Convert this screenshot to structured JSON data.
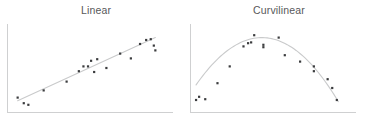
{
  "figure": {
    "background_color": "#ffffff",
    "panel_count": 2
  },
  "panels": [
    {
      "id": "linear",
      "title": "Linear"
    },
    {
      "id": "curvilinear",
      "title": "Curvilinear"
    }
  ],
  "chart_data": [
    {
      "type": "scatter",
      "title": "Linear",
      "xlabel": "",
      "ylabel": "",
      "grid": false,
      "legend": null,
      "axes": {
        "left_spine": true,
        "bottom_spine": true,
        "ticks": false,
        "tick_labels": false
      },
      "axis_color": "#cfd0d1",
      "point_color": "#3b3c3e",
      "trendline": {
        "kind": "linear",
        "color": "#c9cacb",
        "x_start": 5,
        "y_start": 9,
        "x_end": 95,
        "y_end": 88
      },
      "xlim": [
        0,
        100
      ],
      "ylim": [
        0,
        100
      ],
      "points": [
        {
          "x": 5,
          "y": 13
        },
        {
          "x": 9,
          "y": 6
        },
        {
          "x": 12,
          "y": 4
        },
        {
          "x": 22,
          "y": 22
        },
        {
          "x": 37,
          "y": 33
        },
        {
          "x": 45,
          "y": 46
        },
        {
          "x": 48,
          "y": 52
        },
        {
          "x": 51,
          "y": 52
        },
        {
          "x": 53,
          "y": 59
        },
        {
          "x": 55,
          "y": 45
        },
        {
          "x": 57,
          "y": 61
        },
        {
          "x": 63,
          "y": 50
        },
        {
          "x": 72,
          "y": 68
        },
        {
          "x": 79,
          "y": 62
        },
        {
          "x": 85,
          "y": 80
        },
        {
          "x": 89,
          "y": 85
        },
        {
          "x": 92,
          "y": 86
        },
        {
          "x": 94,
          "y": 78
        },
        {
          "x": 95,
          "y": 72
        }
      ]
    },
    {
      "type": "scatter",
      "title": "Curvilinear",
      "xlabel": "",
      "ylabel": "",
      "grid": false,
      "legend": null,
      "axes": {
        "left_spine": true,
        "bottom_spine": true,
        "ticks": false,
        "tick_labels": false
      },
      "axis_color": "#cfd0d1",
      "point_color": "#3b3c3e",
      "trendline": {
        "kind": "quadratic",
        "color": "#c9cacb",
        "vertex_x": 45,
        "vertex_y": 88,
        "x_start": 2,
        "x_end": 95
      },
      "xlim": [
        0,
        100
      ],
      "ylim": [
        0,
        100
      ],
      "points": [
        {
          "x": 2,
          "y": 10
        },
        {
          "x": 4,
          "y": 14
        },
        {
          "x": 8,
          "y": 11
        },
        {
          "x": 16,
          "y": 31
        },
        {
          "x": 24,
          "y": 52
        },
        {
          "x": 33,
          "y": 77
        },
        {
          "x": 36,
          "y": 81
        },
        {
          "x": 38,
          "y": 82
        },
        {
          "x": 40,
          "y": 91
        },
        {
          "x": 46,
          "y": 79
        },
        {
          "x": 46,
          "y": 76
        },
        {
          "x": 56,
          "y": 88
        },
        {
          "x": 60,
          "y": 66
        },
        {
          "x": 70,
          "y": 58
        },
        {
          "x": 79,
          "y": 52
        },
        {
          "x": 79,
          "y": 46
        },
        {
          "x": 88,
          "y": 36
        },
        {
          "x": 91,
          "y": 25
        },
        {
          "x": 94,
          "y": 10
        }
      ]
    }
  ]
}
